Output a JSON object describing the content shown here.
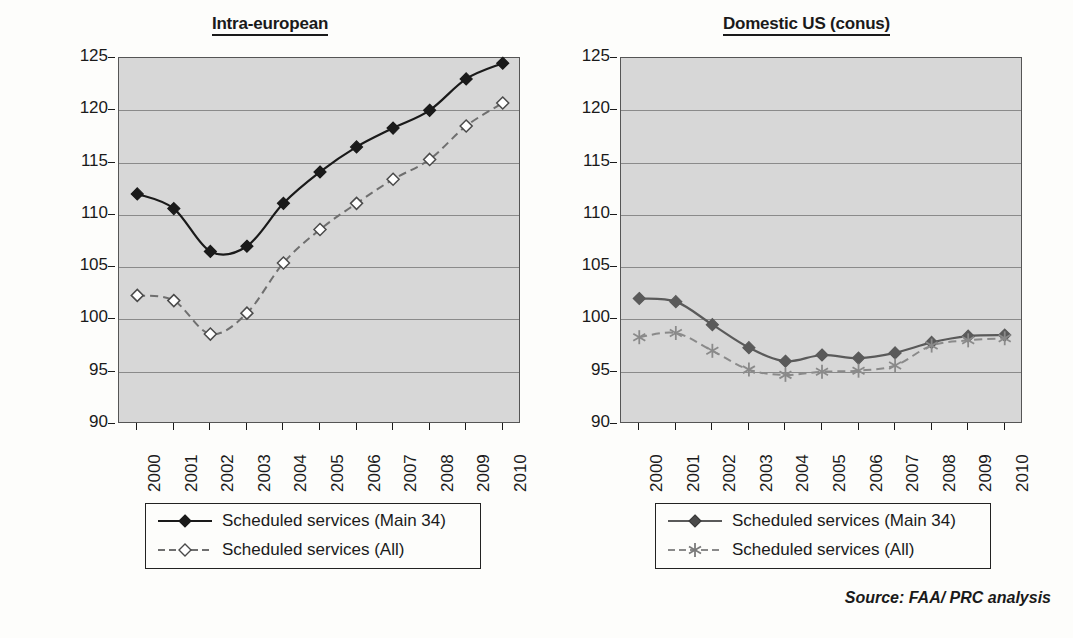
{
  "source_note": "Source: FAA/ PRC analysis",
  "axis": {
    "y_title": "Avg. seats per flight",
    "y_ticks": [
      "125",
      "120",
      "115",
      "110",
      "105",
      "100",
      "95",
      "90"
    ],
    "x_ticks": [
      "2000",
      "2001",
      "2002",
      "2003",
      "2004",
      "2005",
      "2006",
      "2007",
      "2008",
      "2009",
      "2010"
    ]
  },
  "panels": [
    {
      "title": "Intra-european",
      "legend": [
        {
          "label": "Scheduled services (Main 34)",
          "marker": "filled-diamond-icon",
          "style": "solid"
        },
        {
          "label": "Scheduled services (All)",
          "marker": "open-diamond-icon",
          "style": "dashed"
        }
      ]
    },
    {
      "title": "Domestic US (conus)",
      "legend": [
        {
          "label": "Scheduled services (Main 34)",
          "marker": "filled-diamond-icon",
          "style": "solid"
        },
        {
          "label": "Scheduled services (All)",
          "marker": "asterisk-icon",
          "style": "dashed"
        }
      ]
    }
  ],
  "chart_data": [
    {
      "type": "line",
      "title": "Intra-european",
      "xlabel": "",
      "ylabel": "Avg. seats per flight",
      "ylim": [
        90,
        125
      ],
      "ytick_step": 5,
      "grid": true,
      "legend_position": "below",
      "x": [
        2000,
        2001,
        2002,
        2003,
        2004,
        2005,
        2006,
        2007,
        2008,
        2009,
        2010
      ],
      "series": [
        {
          "name": "Scheduled services (Main 34)",
          "marker": "filled-diamond",
          "line": "solid",
          "color": "#1a1a1a",
          "values": [
            112.0,
            110.6,
            106.5,
            107.0,
            111.1,
            114.1,
            116.5,
            118.3,
            120.0,
            123.0,
            124.5
          ]
        },
        {
          "name": "Scheduled services (All)",
          "marker": "open-diamond",
          "line": "dashed",
          "color": "#6f6f6f",
          "values": [
            102.3,
            101.8,
            98.6,
            100.6,
            105.4,
            108.6,
            111.1,
            113.4,
            115.3,
            118.5,
            120.7
          ]
        }
      ]
    },
    {
      "type": "line",
      "title": "Domestic US (conus)",
      "xlabel": "",
      "ylabel": "Avg. seats per flight",
      "ylim": [
        90,
        125
      ],
      "ytick_step": 5,
      "grid": true,
      "legend_position": "below",
      "x": [
        2000,
        2001,
        2002,
        2003,
        2004,
        2005,
        2006,
        2007,
        2008,
        2009,
        2010
      ],
      "series": [
        {
          "name": "Scheduled services (Main 34)",
          "marker": "filled-diamond",
          "line": "solid",
          "color": "#5a5a5a",
          "values": [
            102.0,
            101.7,
            99.5,
            97.3,
            96.0,
            96.6,
            96.3,
            96.8,
            97.8,
            98.4,
            98.5
          ]
        },
        {
          "name": "Scheduled services (All)",
          "marker": "asterisk",
          "line": "dashed",
          "color": "#8a8a8a",
          "values": [
            98.3,
            98.7,
            97.0,
            95.2,
            94.7,
            95.0,
            95.1,
            95.6,
            97.5,
            98.0,
            98.2
          ]
        }
      ]
    }
  ]
}
